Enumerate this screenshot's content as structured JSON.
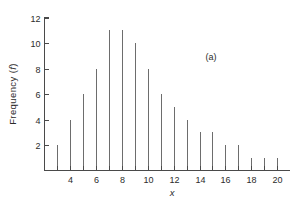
{
  "chart_data": {
    "type": "bar",
    "title": "",
    "subtitle": "",
    "xlabel": "x",
    "ylabel": "Frequency (f)",
    "ylabel_parts": {
      "prefix": "Frequency (",
      "italic": "f",
      "suffix": ")"
    },
    "annotation": "(a)",
    "annotation_position": "upper-right",
    "legend": null,
    "grid": false,
    "xlim": [
      2,
      21
    ],
    "ylim": [
      0,
      12
    ],
    "xtick_values": [
      3,
      4,
      5,
      6,
      7,
      8,
      9,
      10,
      11,
      12,
      13,
      14,
      15,
      16,
      17,
      18,
      19,
      20
    ],
    "xtick_labels_shown": [
      "4",
      "6",
      "8",
      "10",
      "12",
      "14",
      "16",
      "18",
      "20"
    ],
    "xtick_labels_shown_values": [
      4,
      6,
      8,
      10,
      12,
      14,
      16,
      18,
      20
    ],
    "ytick_values": [
      2,
      4,
      6,
      8,
      10,
      12
    ],
    "ytick_labels": [
      "2",
      "4",
      "6",
      "8",
      "10",
      "12"
    ],
    "categories": [
      3,
      4,
      5,
      6,
      7,
      8,
      9,
      10,
      11,
      12,
      13,
      14,
      15,
      16,
      17,
      18,
      19,
      20
    ],
    "values": [
      2,
      4,
      6,
      8,
      11,
      11,
      10,
      8,
      6,
      5,
      4,
      3,
      3,
      2,
      2,
      1,
      1,
      1
    ],
    "series": [
      {
        "name": "Frequency (f)",
        "values": [
          2,
          4,
          6,
          8,
          11,
          11,
          10,
          8,
          6,
          5,
          4,
          3,
          3,
          2,
          2,
          1,
          1,
          1
        ]
      }
    ],
    "colors": {
      "stem": "#6d6d6d",
      "axis": "#4a4a4a",
      "text": "#2b2b2b",
      "background": "#ffffff"
    }
  }
}
